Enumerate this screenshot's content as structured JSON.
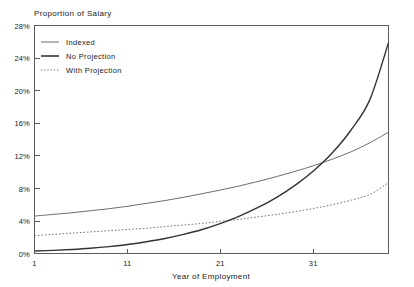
{
  "chart_data": {
    "type": "line",
    "title": "Proportion of Salary",
    "xlabel": "Year of Employment",
    "ylabel": "Proportion of Salary",
    "xlim": [
      1,
      39
    ],
    "ylim": [
      0,
      28
    ],
    "grid": false,
    "legend_position": "upper-left-inside",
    "x_ticks": [
      "1",
      "11",
      "21",
      "31"
    ],
    "x_tick_values": [
      1,
      11,
      21,
      31
    ],
    "y_ticks": [
      "0%",
      "4%",
      "8%",
      "12%",
      "16%",
      "20%",
      "24%",
      "28%"
    ],
    "y_tick_values": [
      0,
      4,
      8,
      12,
      16,
      20,
      24,
      28
    ],
    "x": [
      1,
      3,
      5,
      7,
      9,
      11,
      13,
      15,
      17,
      19,
      21,
      23,
      25,
      27,
      29,
      31,
      33,
      35,
      37,
      39
    ],
    "series": [
      {
        "name": "Indexed",
        "style": "solid-thin",
        "color": "#6e6e6e",
        "values": [
          4.6,
          4.8,
          5.0,
          5.25,
          5.5,
          5.8,
          6.15,
          6.5,
          6.9,
          7.35,
          7.8,
          8.3,
          8.85,
          9.45,
          10.1,
          10.8,
          11.6,
          12.5,
          13.6,
          14.9
        ]
      },
      {
        "name": "No Projection",
        "style": "solid-thick",
        "color": "#333333",
        "values": [
          0.3,
          0.38,
          0.5,
          0.65,
          0.85,
          1.1,
          1.45,
          1.85,
          2.35,
          2.95,
          3.7,
          4.6,
          5.65,
          6.9,
          8.4,
          10.2,
          12.4,
          15.2,
          18.9,
          25.9
        ]
      },
      {
        "name": "With Projection",
        "style": "dotted",
        "color": "#737373",
        "values": [
          2.2,
          2.35,
          2.5,
          2.65,
          2.8,
          2.95,
          3.1,
          3.3,
          3.5,
          3.7,
          3.95,
          4.2,
          4.5,
          4.8,
          5.15,
          5.55,
          6.0,
          6.55,
          7.25,
          8.7
        ]
      }
    ]
  },
  "legend": {
    "items": [
      {
        "label": "Indexed"
      },
      {
        "label": "No Projection"
      },
      {
        "label": "With Projection"
      }
    ]
  }
}
